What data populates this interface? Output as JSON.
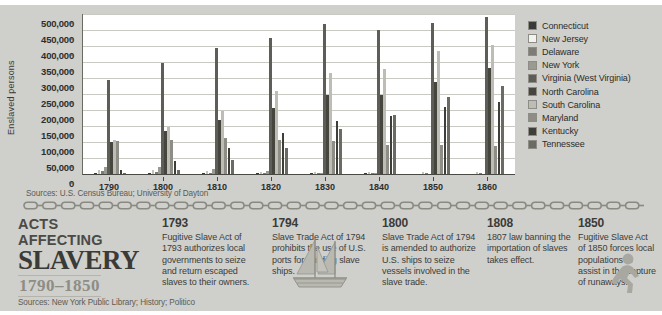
{
  "chart_data": {
    "type": "bar",
    "title": "",
    "xlabel": "",
    "ylabel": "Enslaved persons",
    "ylim": [
      0,
      500000
    ],
    "ytick_labels": [
      "0",
      "50,000",
      "100,000",
      "150,000",
      "200,000",
      "250,000",
      "300,000",
      "350,000",
      "400,000",
      "450,000",
      "500,000"
    ],
    "ytick_values": [
      0,
      50000,
      100000,
      150000,
      200000,
      250000,
      300000,
      350000,
      400000,
      450000,
      500000
    ],
    "grid": true,
    "legend_position": "right",
    "categories": [
      "1790",
      "1800",
      "1810",
      "1820",
      "1830",
      "1840",
      "1850",
      "1860"
    ],
    "series": [
      {
        "name": "Connecticut",
        "color": "#3a3a38",
        "values": [
          2764,
          951,
          310,
          97,
          25,
          17,
          0,
          0
        ]
      },
      {
        "name": "New Jersey",
        "color": "#f2f2ee",
        "values": [
          11423,
          12422,
          10851,
          7557,
          2254,
          674,
          236,
          18
        ]
      },
      {
        "name": "Delaware",
        "color": "#7d7d76",
        "values": [
          8887,
          6153,
          4177,
          4509,
          3292,
          2605,
          2290,
          1798
        ]
      },
      {
        "name": "New York",
        "color": "#9a9a93",
        "values": [
          21324,
          20903,
          15017,
          10088,
          75,
          4,
          0,
          0
        ]
      },
      {
        "name": "Virginia (West Virginia)",
        "color": "#5e5e58",
        "values": [
          292627,
          345796,
          392518,
          425153,
          469757,
          449087,
          472528,
          490865
        ]
      },
      {
        "name": "North Carolina",
        "color": "#46463f",
        "values": [
          100572,
          133296,
          168824,
          205017,
          245601,
          245817,
          288548,
          331059
        ]
      },
      {
        "name": "South Carolina",
        "color": "#bdbdb6",
        "values": [
          107094,
          146151,
          196365,
          258475,
          315401,
          327038,
          384984,
          402406
        ]
      },
      {
        "name": "Maryland",
        "color": "#8e8e87",
        "values": [
          103036,
          105635,
          111502,
          107397,
          102994,
          89737,
          90368,
          87189
        ]
      },
      {
        "name": "Kentucky",
        "color": "#3f3f39",
        "values": [
          12430,
          40343,
          80561,
          126732,
          165213,
          182258,
          210981,
          225483
        ]
      },
      {
        "name": "Tennessee",
        "color": "#6b6b64",
        "values": [
          3417,
          13584,
          44535,
          80107,
          141603,
          183059,
          239459,
          275719
        ]
      }
    ]
  },
  "chart": {
    "source_note": "Sources: U.S. Census Bureau; University of Dayton"
  },
  "title_block": {
    "line1": "ACTS AFFECTING",
    "line2": "SLAVERY",
    "line3": "1790–1850"
  },
  "timeline": {
    "events": [
      {
        "year": "1793",
        "text": "Fugitive Slave Act of 1793 authorizes local governments to seize and return escaped slaves to their owners."
      },
      {
        "year": "1794",
        "text": "Slave Trade Act of 1794 prohibits the use of U.S. ports for building slave ships."
      },
      {
        "year": "1800",
        "text": "Slave Trade Act of 1794 is amended to authorize U.S. ships to seize vessels involved in the slave trade."
      },
      {
        "year": "1808",
        "text": "1807 law banning the importation of slaves takes effect."
      },
      {
        "year": "1850",
        "text": "Fugitive Slave Act of 1850 forces local populations to assist in the capture of runaways."
      }
    ],
    "source_note": "Sources: New York Public Library; History; Politico"
  },
  "icons": {
    "ship": "sailing-ship-icon",
    "runner": "running-person-icon",
    "chain": "chain-divider-icon"
  },
  "colors": {
    "background": "#cfcfcb",
    "plot_background": "#ffffff",
    "text": "#3a3a38",
    "accent_gray": "#8d8d86"
  }
}
